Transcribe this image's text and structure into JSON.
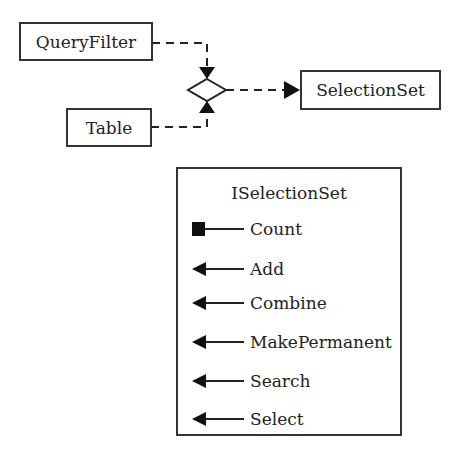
{
  "diagram": {
    "classes": {
      "query_filter": "QueryFilter",
      "table": "Table",
      "selection_set": "SelectionSet"
    },
    "relationship": {
      "inputs": [
        "QueryFilter",
        "Table"
      ],
      "output": "SelectionSet",
      "line_style": "dashed",
      "junction": "diamond"
    },
    "interface": {
      "name": "ISelectionSet",
      "members": [
        {
          "label": "Count",
          "kind": "property",
          "icon": "square-property-icon"
        },
        {
          "label": "Add",
          "kind": "method",
          "icon": "arrow-method-icon"
        },
        {
          "label": "Combine",
          "kind": "method",
          "icon": "arrow-method-icon"
        },
        {
          "label": "MakePermanent",
          "kind": "method",
          "icon": "arrow-method-icon"
        },
        {
          "label": "Search",
          "kind": "method",
          "icon": "arrow-method-icon"
        },
        {
          "label": "Select",
          "kind": "method",
          "icon": "arrow-method-icon"
        }
      ]
    }
  }
}
